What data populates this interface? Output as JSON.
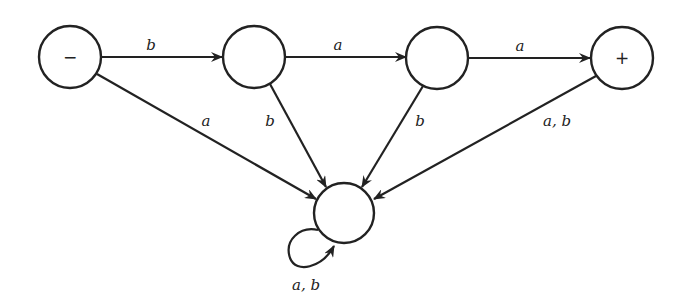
{
  "diagram": {
    "type": "finite-automaton",
    "states": [
      {
        "id": "s1",
        "label": "−",
        "role": "start"
      },
      {
        "id": "s2",
        "label": ""
      },
      {
        "id": "s3",
        "label": ""
      },
      {
        "id": "s4",
        "label": "+",
        "role": "final"
      },
      {
        "id": "s5",
        "label": ""
      }
    ],
    "edges": [
      {
        "from": "s1",
        "to": "s2",
        "label": "b"
      },
      {
        "from": "s2",
        "to": "s3",
        "label": "a"
      },
      {
        "from": "s3",
        "to": "s4",
        "label": "a"
      },
      {
        "from": "s1",
        "to": "s5",
        "label": "a"
      },
      {
        "from": "s2",
        "to": "s5",
        "label": "b"
      },
      {
        "from": "s3",
        "to": "s5",
        "label": "b"
      },
      {
        "from": "s4",
        "to": "s5",
        "label": "a, b"
      },
      {
        "from": "s5",
        "to": "s5",
        "label": "a, b"
      }
    ]
  }
}
